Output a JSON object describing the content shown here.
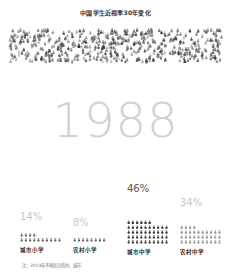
{
  "chart_data": {
    "type": "pictogram",
    "title": "中国学生近视率30年变化",
    "year": "1988",
    "categories": [
      "城市小学",
      "农村小学",
      "城市中学",
      "农村中学"
    ],
    "values": [
      14,
      8,
      46,
      34
    ],
    "value_labels": [
      "14%",
      "8%",
      "46%",
      "34%"
    ],
    "unit": "%",
    "icon": "person-icon",
    "note": "注：2014年不再区分农村、城市"
  },
  "header": {
    "title": "中国学生近视率30年变化"
  },
  "main": {
    "year": "1988",
    "groups": [
      {
        "label": "城市小学",
        "value_label": "14%",
        "value": 14,
        "color": "#555555",
        "pct_color": "#c8c8c8"
      },
      {
        "label": "农村小学",
        "value_label": "8%",
        "value": 8,
        "color": "#555555",
        "pct_color": "#c8c8c8"
      },
      {
        "label": "城市中学",
        "value_label": "46%",
        "value": 46,
        "color": "#222222",
        "pct_color": "#555555"
      },
      {
        "label": "农村中学",
        "value_label": "34%",
        "value": 34,
        "color": "#888888",
        "pct_color": "#c8c8c8"
      }
    ]
  },
  "footer": {
    "note": "注：2014年不再区分农村、城市"
  }
}
